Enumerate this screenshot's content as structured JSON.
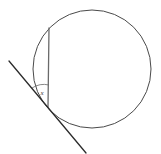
{
  "figure": {
    "type": "geometry-diagram",
    "canvas": {
      "width": 161,
      "height": 154,
      "background": "#ffffff"
    },
    "labels": {
      "angle": "x"
    },
    "colors": {
      "circle_stroke": "#4a4a4a",
      "chord_stroke": "#6a6a6a",
      "tangent_stroke": "#2b2b2b",
      "arc_stroke": "#6a6a6a",
      "label_color": "#3a3a3a",
      "background": "#ffffff"
    },
    "shapes": {
      "circle": {
        "name": "circle",
        "center_x": 92,
        "center_y": 69,
        "radius": 59,
        "stroke_width": 1
      },
      "chord": {
        "name": "chord",
        "x1": 49,
        "y1": 28,
        "x2": 48,
        "y2": 107,
        "stroke_width": 1.3,
        "description": "vertical chord from upper circle edge down to tangency point"
      },
      "tangent": {
        "name": "tangent-line",
        "x1": 9,
        "y1": 61,
        "x2": 86,
        "y2": 153,
        "stroke_width": 1.3,
        "description": "tangent line touching circle at lower end of chord"
      },
      "tangency_point": {
        "name": "tangency-point",
        "x": 48,
        "y": 107
      },
      "angle_arc": {
        "name": "angle-arc",
        "vertex_x": 48,
        "vertex_y": 107,
        "radius": 22,
        "start_x": 49,
        "start_y": 85,
        "end_x": 32,
        "end_y": 88,
        "stroke_width": 0.8
      },
      "angle_label_position": {
        "x": 42,
        "y": 93
      }
    }
  }
}
